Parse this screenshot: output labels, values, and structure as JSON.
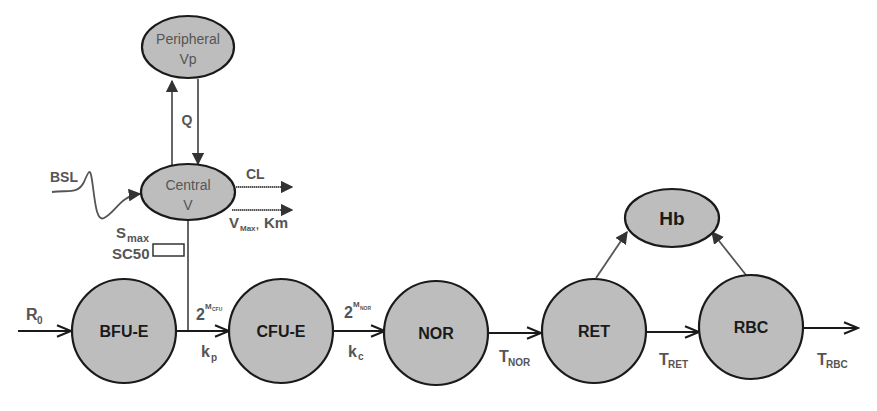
{
  "diagram": {
    "type": "pk-pd compartment model",
    "pk_nodes": [
      {
        "id": "peripheral",
        "line1": "Peripheral",
        "line2": "Vp"
      },
      {
        "id": "central",
        "line1": "Central",
        "line2": "V"
      }
    ],
    "pk_labels": {
      "q": "Q",
      "bsl": "BSL",
      "cl": "CL",
      "vmax": "V",
      "vmax_sub": "Max",
      "vmax_sep": ",",
      "km": "Km",
      "smax": "S",
      "smax_sub": "max",
      "sc50": "SC50"
    },
    "cell_nodes": [
      {
        "id": "bfu-e",
        "label": "BFU-E"
      },
      {
        "id": "cfu-e",
        "label": "CFU-E"
      },
      {
        "id": "nor",
        "label": "NOR"
      },
      {
        "id": "ret",
        "label": "RET"
      },
      {
        "id": "rbc",
        "label": "RBC"
      }
    ],
    "hb_node": {
      "id": "hb",
      "label": "Hb"
    },
    "rate_labels": {
      "r0": "R",
      "r0_sub": "0",
      "mcfu_base": "2",
      "mcfu_exp": "M",
      "mcfu_exp_sub": "CFU",
      "kp": "k",
      "kp_sub": "p",
      "mnor_base": "2",
      "mnor_exp": "M",
      "mnor_exp_sub": "NOR",
      "kc": "k",
      "kc_sub": "c",
      "tnor": "T",
      "tnor_sub": "NOR",
      "tret": "T",
      "tret_sub": "RET",
      "trbc": "T",
      "trbc_sub": "RBC"
    }
  }
}
